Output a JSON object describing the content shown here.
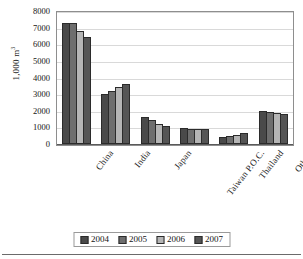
{
  "chart_data": {
    "type": "bar",
    "title": "",
    "xlabel": "",
    "ylabel": "1,000 m3",
    "ylabel_display": "1,000 m",
    "ylabel_superscript": "3",
    "ylim": [
      0,
      8000
    ],
    "ytick_step": 1000,
    "yticks": [
      "8000",
      "7000",
      "6000",
      "5000",
      "4000",
      "3000",
      "2000",
      "1000",
      "0"
    ],
    "grid": true,
    "legend_position": "bottom-center",
    "categories": [
      "China",
      "India",
      "Japan",
      "Taiwan P.O.C.",
      "Thailand",
      "Others"
    ],
    "series": [
      {
        "name": "2004",
        "color": "#4a4a4a",
        "values": [
          7300,
          3020,
          1610,
          960,
          400,
          1960
        ]
      },
      {
        "name": "2005",
        "color": "#6e6e6e",
        "values": [
          7300,
          3200,
          1420,
          930,
          480,
          1910
        ]
      },
      {
        "name": "2006",
        "color": "#b5b5b5",
        "values": [
          6800,
          3420,
          1230,
          930,
          560,
          1880
        ]
      },
      {
        "name": "2007",
        "color": "#555555",
        "values": [
          6450,
          3630,
          1090,
          910,
          670,
          1790
        ]
      }
    ]
  },
  "legend": {
    "items": [
      {
        "label": "2004",
        "color": "#4a4a4a"
      },
      {
        "label": "2005",
        "color": "#6e6e6e"
      },
      {
        "label": "2006",
        "color": "#b5b5b5"
      },
      {
        "label": "2007",
        "color": "#555555"
      }
    ]
  }
}
